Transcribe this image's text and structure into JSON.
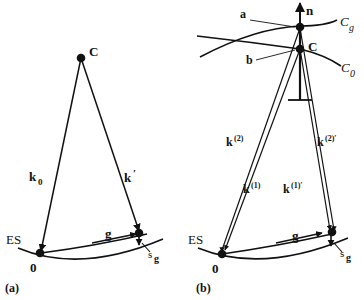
{
  "figure": {
    "panels": [
      {
        "id": "a",
        "caption": "(a)",
        "points": [
          {
            "name": "C",
            "label": "C"
          },
          {
            "name": "origin",
            "label": "0"
          },
          {
            "name": "diffracted-spot",
            "label": ""
          }
        ],
        "vectors": [
          {
            "name": "k0",
            "label": "k",
            "sub": "0"
          },
          {
            "name": "k-prime",
            "label": "k",
            "sup": "′"
          },
          {
            "name": "g",
            "label": "g"
          },
          {
            "name": "sg",
            "label": "s",
            "sub": "g"
          }
        ],
        "curves": [
          {
            "name": "ewald-sphere",
            "label": "ES"
          }
        ]
      },
      {
        "id": "b",
        "caption": "(b)",
        "points": [
          {
            "name": "a",
            "label": "a"
          },
          {
            "name": "b",
            "label": "b"
          },
          {
            "name": "C",
            "label": "C"
          },
          {
            "name": "origin",
            "label": "0"
          },
          {
            "name": "diffracted-spot",
            "label": ""
          }
        ],
        "vectors": [
          {
            "name": "n",
            "label": "n"
          },
          {
            "name": "k2",
            "label": "k",
            "sup": "(2)"
          },
          {
            "name": "k2-prime",
            "label": "k",
            "sup": "(2)′"
          },
          {
            "name": "k1",
            "label": "k",
            "sup": "(1)"
          },
          {
            "name": "k1-prime",
            "label": "k",
            "sup": "(1)′"
          },
          {
            "name": "g",
            "label": "g"
          },
          {
            "name": "sg",
            "label": "s",
            "sub": "g"
          }
        ],
        "curves": [
          {
            "name": "ewald-sphere",
            "label": "ES"
          },
          {
            "name": "dispersion-surface-cg",
            "label": "C",
            "sub": "g"
          },
          {
            "name": "dispersion-surface-c0",
            "label": "C",
            "sub": "0"
          }
        ]
      }
    ],
    "labels": {
      "panel_a_caption": "(a)",
      "panel_b_caption": "(b)",
      "es_a": "ES",
      "es_b": "ES",
      "point_c_a": "C",
      "point_c_b": "C",
      "origin_a": "0",
      "origin_b": "0",
      "point_a": "a",
      "point_b": "b",
      "normal_n": "n",
      "k0_base": "k",
      "k0_sub": "0",
      "kprime_base": "k",
      "kprime_sup": "′",
      "g_a": "g",
      "g_b": "g",
      "sg_base_a": "s",
      "sg_sub_a": "g",
      "sg_base_b": "s",
      "sg_sub_b": "g",
      "k2_base": "k",
      "k2_sup": "(2)",
      "k2p_base": "k",
      "k2p_sup": "(2)′",
      "k1_base": "k",
      "k1_sup": "(1)",
      "k1p_base": "k",
      "k1p_sup": "(1)′",
      "cg_base": "C",
      "cg_sub": "g",
      "c0_base": "C",
      "c0_sub": "0"
    },
    "colors": {
      "ink": "#111111",
      "background": "#ffffff"
    }
  }
}
